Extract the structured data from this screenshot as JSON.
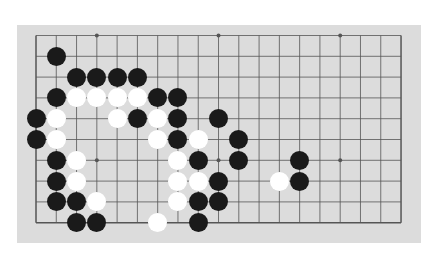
{
  "board": {
    "columns": 19,
    "rows_visible": 10,
    "origin_x": 36,
    "origin_y": 35.5,
    "step_x": 20.28,
    "step_y": 20.8,
    "colors": {
      "background": "#dcdcdc",
      "line": "#555555",
      "black": "#1a1a1a",
      "white": "#ffffff"
    },
    "star_points": [
      [
        3,
        0
      ],
      [
        9,
        0
      ],
      [
        15,
        0
      ],
      [
        3,
        6
      ],
      [
        9,
        6
      ],
      [
        15,
        6
      ]
    ],
    "stones": [
      {
        "c": 1,
        "r": 1,
        "color": "black"
      },
      {
        "c": 2,
        "r": 2,
        "color": "black"
      },
      {
        "c": 3,
        "r": 2,
        "color": "black"
      },
      {
        "c": 4,
        "r": 2,
        "color": "black"
      },
      {
        "c": 5,
        "r": 2,
        "color": "black"
      },
      {
        "c": 1,
        "r": 3,
        "color": "black"
      },
      {
        "c": 2,
        "r": 3,
        "color": "white"
      },
      {
        "c": 3,
        "r": 3,
        "color": "white"
      },
      {
        "c": 4,
        "r": 3,
        "color": "white"
      },
      {
        "c": 5,
        "r": 3,
        "color": "white"
      },
      {
        "c": 6,
        "r": 3,
        "color": "black"
      },
      {
        "c": 7,
        "r": 3,
        "color": "black"
      },
      {
        "c": 0,
        "r": 4,
        "color": "black"
      },
      {
        "c": 1,
        "r": 4,
        "color": "white"
      },
      {
        "c": 4,
        "r": 4,
        "color": "white"
      },
      {
        "c": 5,
        "r": 4,
        "color": "black"
      },
      {
        "c": 6,
        "r": 4,
        "color": "white"
      },
      {
        "c": 7,
        "r": 4,
        "color": "black"
      },
      {
        "c": 9,
        "r": 4,
        "color": "black"
      },
      {
        "c": 0,
        "r": 5,
        "color": "black"
      },
      {
        "c": 1,
        "r": 5,
        "color": "white"
      },
      {
        "c": 6,
        "r": 5,
        "color": "white"
      },
      {
        "c": 7,
        "r": 5,
        "color": "black"
      },
      {
        "c": 8,
        "r": 5,
        "color": "white"
      },
      {
        "c": 10,
        "r": 5,
        "color": "black"
      },
      {
        "c": 1,
        "r": 6,
        "color": "black"
      },
      {
        "c": 2,
        "r": 6,
        "color": "white"
      },
      {
        "c": 7,
        "r": 6,
        "color": "white"
      },
      {
        "c": 8,
        "r": 6,
        "color": "black"
      },
      {
        "c": 10,
        "r": 6,
        "color": "black"
      },
      {
        "c": 13,
        "r": 6,
        "color": "black"
      },
      {
        "c": 1,
        "r": 7,
        "color": "black"
      },
      {
        "c": 2,
        "r": 7,
        "color": "white"
      },
      {
        "c": 7,
        "r": 7,
        "color": "white"
      },
      {
        "c": 8,
        "r": 7,
        "color": "white"
      },
      {
        "c": 9,
        "r": 7,
        "color": "black"
      },
      {
        "c": 12,
        "r": 7,
        "color": "white"
      },
      {
        "c": 13,
        "r": 7,
        "color": "black"
      },
      {
        "c": 1,
        "r": 8,
        "color": "black"
      },
      {
        "c": 2,
        "r": 8,
        "color": "black"
      },
      {
        "c": 3,
        "r": 8,
        "color": "white"
      },
      {
        "c": 7,
        "r": 8,
        "color": "white"
      },
      {
        "c": 8,
        "r": 8,
        "color": "black"
      },
      {
        "c": 9,
        "r": 8,
        "color": "black"
      },
      {
        "c": 2,
        "r": 9,
        "color": "black"
      },
      {
        "c": 3,
        "r": 9,
        "color": "black"
      },
      {
        "c": 6,
        "r": 9,
        "color": "white"
      },
      {
        "c": 8,
        "r": 9,
        "color": "black"
      }
    ]
  }
}
